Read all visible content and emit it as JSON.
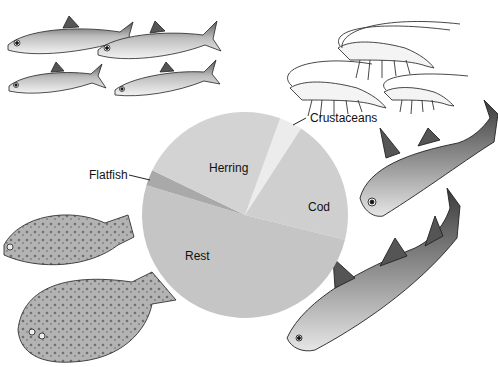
{
  "chart_data": {
    "type": "pie",
    "title": "",
    "start_angle_deg_clockwise_from_top": 20,
    "slices": [
      {
        "label": "Crustaceans",
        "value": 3.6,
        "color": "#ececec",
        "label_style": "leader"
      },
      {
        "label": "Cod",
        "value": 19.7,
        "color": "#cfcfcf",
        "label_style": "inside"
      },
      {
        "label": "Rest",
        "value": 50.8,
        "color": "#c5c5c5",
        "label_style": "inside"
      },
      {
        "label": "Flatfish",
        "value": 2.5,
        "color": "#a9a9a9",
        "label_style": "leader"
      },
      {
        "label": "Herring",
        "value": 23.4,
        "color": "#d3d3d3",
        "label_style": "inside"
      }
    ],
    "categories": [
      "Crustaceans",
      "Cod",
      "Rest",
      "Flatfish",
      "Herring"
    ],
    "values": [
      3.6,
      19.7,
      50.8,
      2.5,
      23.4
    ],
    "legend": "none (direct labels)",
    "units": "approximate % of total"
  },
  "labels": {
    "crustaceans": "Crustaceans",
    "cod": "Cod",
    "rest": "Rest",
    "flatfish": "Flatfish",
    "herring": "Herring"
  },
  "illustrations": {
    "top_left": "herring-school",
    "top_right": "shrimp-group",
    "bottom_left": "flatfish-pair",
    "right": "cod-pair"
  }
}
